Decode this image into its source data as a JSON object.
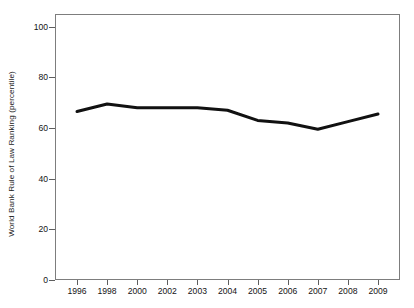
{
  "chart_data": {
    "type": "line",
    "title": "",
    "xlabel": "",
    "ylabel": "World Bank Rule of Law Ranking (percentile)",
    "categories": [
      "1996",
      "1998",
      "2000",
      "2002",
      "2003",
      "2004",
      "2005",
      "2006",
      "2007",
      "2008",
      "2009"
    ],
    "values": [
      66.5,
      69.5,
      68,
      68,
      68,
      67,
      63,
      62,
      59.5,
      62.5,
      65.5
    ],
    "series": [
      {
        "name": "World Bank Rule of Law Ranking (percentile)",
        "values": [
          66.5,
          69.5,
          68,
          68,
          68,
          67,
          63,
          62,
          59.5,
          62.5,
          65.5
        ],
        "color": "#111111"
      }
    ],
    "ylim": [
      0,
      105
    ],
    "yticks": [
      0,
      20,
      40,
      60,
      80,
      100
    ],
    "ytick_labels": [
      "0",
      "20",
      "40",
      "60",
      "80",
      "100"
    ],
    "grid": false,
    "legend": "none",
    "line_color": "#111111",
    "line_width": 3,
    "frame_color": "#7d7d7d",
    "background_color": "#ffffff"
  }
}
